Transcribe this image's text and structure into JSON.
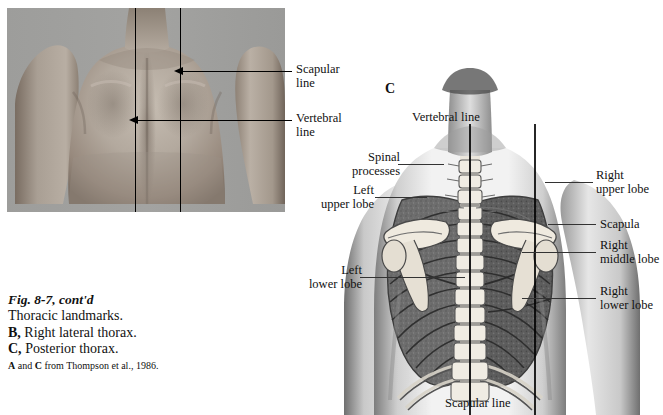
{
  "figure": {
    "caption_line1": "Fig. 8-7, cont'd",
    "caption_line2": "Thoracic landmarks.",
    "caption_line3_key": "B,",
    "caption_line3_text": " Right lateral thorax.",
    "caption_line4_key": "C,",
    "caption_line4_text": " Posterior thorax.",
    "source_key_a": "A",
    "source_mid": " and ",
    "source_key_c": "C",
    "source_text": " from Thompson et al., 1986."
  },
  "panel_b": {
    "panel_letter": "B",
    "description": "black-and-white photograph of a male posterior thorax with two vertical reference lines drawn on the back",
    "labels": [
      {
        "id": "scapular",
        "line1": "Scapular",
        "line2": "line"
      },
      {
        "id": "vertebral",
        "line1": "Vertebral",
        "line2": "line"
      }
    ]
  },
  "panel_c": {
    "panel_letter": "C",
    "description": "anatomical illustration of a posterior thorax showing lungs, ribs, vertebral column and scapulae",
    "top_label": "Vertebral line",
    "bottom_label": "Scapular line",
    "labels": {
      "spinal_processes_l1": "Spinal",
      "spinal_processes_l2": "processes",
      "left_upper_l1": "Left",
      "left_upper_l2": "upper lobe",
      "left_lower_l1": "Left",
      "left_lower_l2": "lower lobe",
      "right_upper_l1": "Right",
      "right_upper_l2": "upper lobe",
      "scapula": "Scapula",
      "right_middle_l1": "Right",
      "right_middle_l2": "middle lobe",
      "right_lower_l1": "Right",
      "right_lower_l2": "lower lobe"
    }
  },
  "colors": {
    "page_background": "#ffffff",
    "ink": "#111111",
    "photo_background": "#9a9a9a",
    "skin_light": "#bfb6ad",
    "skin_mid": "#a79c92",
    "skin_dark": "#7d7067",
    "lung_fill": "#6d6d6d",
    "bone_light": "#e8e3da",
    "rule": "#333333"
  }
}
